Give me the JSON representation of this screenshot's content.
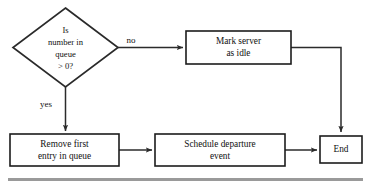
{
  "diagram": {
    "type": "flowchart",
    "colors": {
      "stroke": "#2b2b2b",
      "fill": "#ffffff",
      "text": "#111111",
      "rule": "#9a9a9a"
    },
    "nodes": {
      "decision": {
        "shape": "diamond",
        "lines": [
          "Is",
          "number in",
          "queue",
          "> 0?"
        ]
      },
      "mark_idle": {
        "shape": "process",
        "lines": [
          "Mark server",
          "as idle"
        ]
      },
      "remove_entry": {
        "shape": "process",
        "lines": [
          "Remove first",
          "entry in queue"
        ]
      },
      "schedule_departure": {
        "shape": "process",
        "lines": [
          "Schedule departure",
          "event"
        ]
      },
      "end": {
        "shape": "terminator",
        "lines": [
          "End"
        ]
      }
    },
    "edge_labels": {
      "no": "no",
      "yes": "yes"
    }
  }
}
